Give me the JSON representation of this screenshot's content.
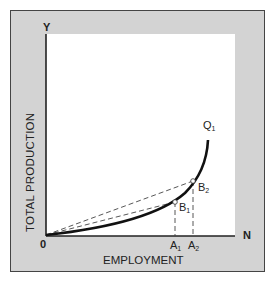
{
  "diagram": {
    "axes": {
      "y_letter": "Y",
      "x_letter": "N",
      "origin": "0",
      "y_title": "TOTAL PRODUCTION",
      "x_title": "EMPLOYMENT"
    },
    "curve_label": {
      "main": "Q",
      "sub": "1"
    },
    "points": [
      {
        "main": "B",
        "sub": "1"
      },
      {
        "main": "B",
        "sub": "2"
      }
    ],
    "ticks": [
      {
        "main": "A",
        "sub": "1"
      },
      {
        "main": "A",
        "sub": "2"
      }
    ],
    "colors": {
      "frame": "#d3d3d3",
      "plot_bg": "#ffffff",
      "curve": "#111111",
      "dashed": "#444444"
    }
  }
}
